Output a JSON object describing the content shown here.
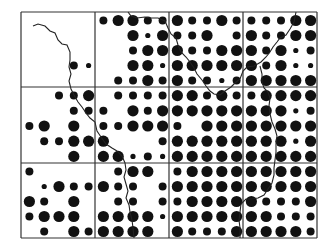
{
  "map": {
    "type": "grid-dot-map",
    "grid": {
      "cols": 4,
      "rows": 3,
      "x": [
        21,
        95,
        169,
        243,
        317
      ],
      "y": [
        12,
        87,
        163,
        238
      ]
    },
    "dot_size_radius": {
      "0": 0,
      "1": 2.6,
      "2": 4.0,
      "3": 5.6
    },
    "dot_color": "#111111",
    "line_color": "#333333",
    "sub_grid": 5,
    "dots": [
      [
        0,
        0,
        0,
        0,
        0,
        2,
        3,
        3,
        2,
        2,
        3,
        2,
        2,
        3,
        2,
        2,
        2,
        2,
        3,
        3
      ],
      [
        0,
        0,
        0,
        0,
        0,
        0,
        0,
        3,
        1,
        3,
        2,
        2,
        3,
        0,
        2,
        3,
        2,
        2,
        3,
        3
      ],
      [
        0,
        0,
        0,
        0,
        0,
        0,
        0,
        2,
        3,
        3,
        3,
        2,
        2,
        3,
        3,
        3,
        2,
        3,
        1,
        2
      ],
      [
        0,
        0,
        0,
        2,
        1,
        0,
        0,
        3,
        3,
        1,
        3,
        3,
        3,
        3,
        3,
        3,
        2,
        3,
        1,
        1
      ],
      [
        0,
        0,
        0,
        0,
        0,
        0,
        2,
        2,
        3,
        2,
        3,
        2,
        2,
        1,
        2,
        3,
        3,
        3,
        3,
        3
      ],
      [
        0,
        0,
        2,
        2,
        3,
        0,
        2,
        2,
        2,
        2,
        3,
        3,
        2,
        3,
        2,
        2,
        3,
        3,
        3,
        3
      ],
      [
        0,
        0,
        0,
        2,
        2,
        2,
        0,
        3,
        2,
        3,
        3,
        3,
        3,
        3,
        3,
        3,
        3,
        3,
        1,
        2
      ],
      [
        2,
        3,
        0,
        3,
        0,
        2,
        2,
        3,
        3,
        3,
        2,
        0,
        3,
        3,
        3,
        3,
        3,
        3,
        3,
        3
      ],
      [
        0,
        2,
        2,
        3,
        3,
        3,
        0,
        0,
        0,
        2,
        3,
        3,
        3,
        3,
        3,
        3,
        3,
        3,
        1,
        3
      ],
      [
        0,
        0,
        0,
        3,
        0,
        3,
        3,
        1,
        2,
        1,
        3,
        3,
        3,
        3,
        3,
        3,
        3,
        3,
        3,
        3
      ],
      [
        2,
        0,
        0,
        0,
        0,
        0,
        2,
        3,
        3,
        0,
        2,
        3,
        3,
        3,
        3,
        3,
        3,
        3,
        3,
        3
      ],
      [
        0,
        1,
        3,
        2,
        2,
        3,
        2,
        2,
        0,
        2,
        3,
        3,
        3,
        3,
        3,
        3,
        3,
        3,
        3,
        3
      ],
      [
        3,
        2,
        0,
        3,
        0,
        0,
        2,
        2,
        0,
        2,
        2,
        3,
        3,
        3,
        3,
        3,
        2,
        2,
        2,
        3
      ],
      [
        2,
        3,
        3,
        3,
        0,
        3,
        3,
        3,
        3,
        1,
        3,
        3,
        3,
        3,
        3,
        3,
        3,
        2,
        2,
        2
      ],
      [
        0,
        2,
        0,
        3,
        2,
        3,
        3,
        3,
        3,
        0,
        3,
        2,
        2,
        2,
        3,
        3,
        3,
        3,
        3,
        2
      ]
    ],
    "river_path": "M33,26 L38,24 L45,26 L50,31 L55,33 L58,40 L62,44 L67,45 L70,52 L70,60 L69,67 L71,74 L69,81 L71,89 L74,95 L78,102 L82,107 L86,113 L90,118 L95,122 L97,131 L101,137 L106,144 L112,148 L117,151 L122,156 L125,163 L126,170 L124,177 L126,184 L128,191 L126,198 L129,205 L130,212 L132,220 L133,228 L134,238",
    "river_path_2": "M128,12 L131,16 L137,18 L145,17 L150,18 L158,18 L165,21 L168,28 L171,34 L176,38 L178,45 L181,52 L186,57 L190,62 L194,68 L197,74 L202,80 L206,86 L210,91 L214,94 L220,95 L225,91 L231,87 L235,83 L240,79 L243,71 L247,67 L254,66 L261,62 L266,57 L270,52 L273,47 L277,42 L280,38 L286,35 L290,29 L294,22 L296,12",
    "river_path_3": "M260,66 L262,74 L262,82 L264,88 L268,92 L270,98 L269,106 L270,114 L272,122 L275,129 L277,136 L276,144 L276,152 L275,160 L274,168 L274,175 L272,183 L268,189 L264,195 L258,198 L252,199 L246,199 L241,204 L240,212 L239,220 L240,228 L240,238"
  }
}
